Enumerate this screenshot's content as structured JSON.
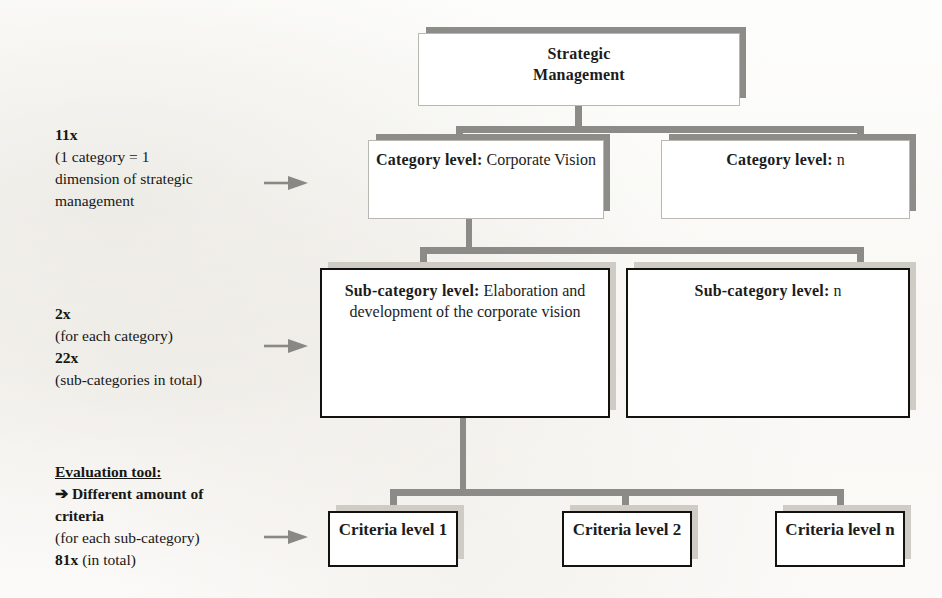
{
  "diagram": {
    "title_box": {
      "line1": "Strategic",
      "line2": "Management"
    },
    "category_level": {
      "left": {
        "heading": "Category level:",
        "value": "Corporate Vision"
      },
      "right": {
        "heading": "Category level:",
        "value": "n"
      }
    },
    "subcategory_level": {
      "left": {
        "heading": "Sub-category level:",
        "value_line1": "Elaboration and development",
        "value_line2": "of the corporate vision"
      },
      "right": {
        "heading": "Sub-category level:",
        "value": "n"
      }
    },
    "criteria_level": [
      {
        "line1": "Criteria",
        "line2": "level 1"
      },
      {
        "line1": "Criteria",
        "line2": "level 2"
      },
      {
        "line1": "Criteria",
        "line2": "level n"
      }
    ]
  },
  "annotations": {
    "category": {
      "count": "11x",
      "line1": "(1 category = 1",
      "line2": "dimension of strategic",
      "line3": "management"
    },
    "subcategory": {
      "count_each": "2x",
      "each_label": "(for each category)",
      "count_total": "22x",
      "total_label": "(sub-categories in total)"
    },
    "criteria": {
      "tool_label": "Evaluation tool:",
      "arrow_glyph": "➔",
      "bold_line1": "Different amount of",
      "bold_line2": "criteria",
      "scope_label": "(for each sub-category)",
      "count_total": "81x",
      "total_label": "(in total)"
    }
  },
  "colors": {
    "connector_gray": "#8d8b87",
    "dark_shadow": "#8e8c88",
    "light_shadow": "#cfccc5",
    "pale_border": "#b9b7b2",
    "dark_border": "#13120f",
    "arrow_gray": "#8a8884",
    "paper": "#fbfaf8"
  }
}
